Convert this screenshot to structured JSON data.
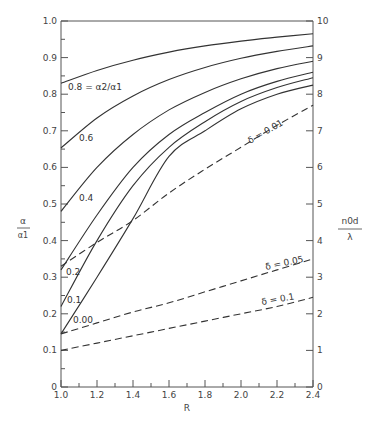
{
  "chart_data": {
    "type": "line",
    "title": "",
    "xlabel": "R",
    "ylabel": "α / α₁",
    "y2label": "n₀d / λ",
    "xlim": [
      1.0,
      2.4
    ],
    "ylim": [
      0,
      1.0
    ],
    "y2lim": [
      0,
      10
    ],
    "grid": false,
    "x_ticks": [
      "1.0",
      "1.2",
      "1.4",
      "1.6",
      "1.8",
      "2.0",
      "2.2",
      "2.4"
    ],
    "y_ticks": [
      "0",
      "0.1",
      "0.2",
      "0.3",
      "0.4",
      "0.5",
      "0.6",
      "0.7",
      "0.8",
      "0.9",
      "1.0"
    ],
    "y2_ticks": [
      "0",
      "1",
      "2",
      "3",
      "4",
      "5",
      "6",
      "7",
      "8",
      "9",
      "10"
    ],
    "x": [
      1.0,
      1.2,
      1.4,
      1.6,
      1.8,
      2.0,
      2.2,
      2.4
    ],
    "series": [
      {
        "name": "0.8 = α₂/α₁",
        "label": "0.8 = α2/α1",
        "axis": "left",
        "style": "solid",
        "values": [
          0.83,
          0.865,
          0.893,
          0.915,
          0.932,
          0.945,
          0.956,
          0.965
        ]
      },
      {
        "name": "0.6",
        "label": "0.6",
        "axis": "left",
        "style": "solid",
        "values": [
          0.653,
          0.735,
          0.795,
          0.84,
          0.873,
          0.898,
          0.917,
          0.932
        ]
      },
      {
        "name": "0.4",
        "label": "0.4",
        "axis": "left",
        "style": "solid",
        "values": [
          0.48,
          0.6,
          0.69,
          0.757,
          0.805,
          0.842,
          0.87,
          0.89
        ]
      },
      {
        "name": "0.2",
        "label": "0.2",
        "axis": "left",
        "style": "solid",
        "values": [
          0.32,
          0.47,
          0.6,
          0.69,
          0.75,
          0.8,
          0.835,
          0.86
        ]
      },
      {
        "name": "0.1",
        "label": "0.1",
        "axis": "left",
        "style": "solid",
        "values": [
          0.22,
          0.4,
          0.55,
          0.655,
          0.725,
          0.78,
          0.818,
          0.845
        ]
      },
      {
        "name": "0.00",
        "label": "0.00",
        "axis": "left",
        "style": "solid",
        "values": [
          0.145,
          0.3,
          0.46,
          0.63,
          0.7,
          0.76,
          0.8,
          0.825
        ]
      },
      {
        "name": "δ = 0.01",
        "label": "δ = 0.01",
        "axis": "right",
        "style": "dashed",
        "values": [
          3.3,
          3.95,
          4.55,
          5.3,
          5.95,
          6.55,
          7.15,
          7.7
        ]
      },
      {
        "name": "δ = 0.05",
        "label": "δ = 0.05",
        "axis": "right",
        "style": "dashed",
        "values": [
          1.45,
          1.75,
          2.05,
          2.3,
          2.6,
          2.9,
          3.2,
          3.5
        ]
      },
      {
        "name": "δ = 0.1",
        "label": "δ = 0.1",
        "axis": "right",
        "style": "dashed",
        "values": [
          1.0,
          1.2,
          1.4,
          1.6,
          1.8,
          2.0,
          2.2,
          2.45
        ]
      }
    ]
  },
  "labels": {
    "x_axis": "R",
    "y_axis_num": "α",
    "y_axis_den": "α1",
    "y2_axis_num": "n0d",
    "y2_axis_den": "λ",
    "curve_08": "0.8 = α2/α1",
    "curve_06": "0.6",
    "curve_04": "0.4",
    "curve_02": "0.2",
    "curve_01": "0.1",
    "curve_000": "0.00",
    "delta_001": "δ = 0.01",
    "delta_005": "δ = 0.05",
    "delta_01": "δ = 0.1"
  }
}
